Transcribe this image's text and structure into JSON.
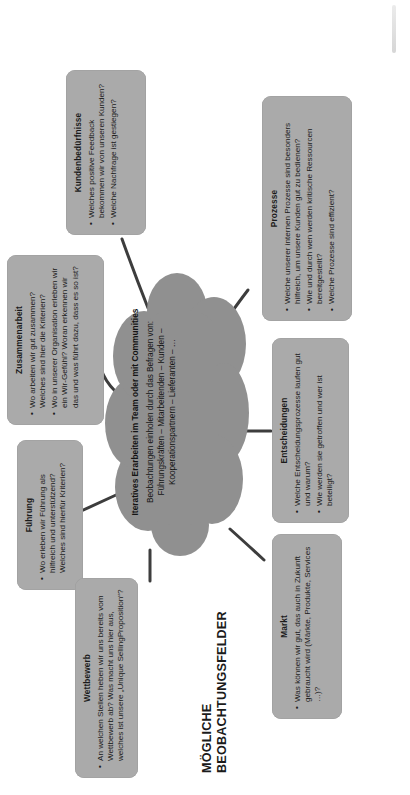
{
  "heading": {
    "line1": "MÖGLICHE",
    "line2": "BEOBACHTUNGSFELDER"
  },
  "colors": {
    "card_fill": "#aaaaaa",
    "cloud_fill": "#909090",
    "connector": "#3d3d3d",
    "text": "#1b1b1b",
    "background": "#ffffff"
  },
  "cloud": {
    "title": "Iteratives Erarbeiten im Team oder mit Communities",
    "body": "Beobachtungen einholen durch das Befragen von: Führungskräften – Mitarbeitenden – Kunden – Kooperationspartnern – Lieferanten – …"
  },
  "cards": {
    "fuehrung": {
      "title": "Führung",
      "bullets": [
        "Wo erleben wir Führung als hilfreich und unterstützend? Welches sind hierfür Kriterien?"
      ]
    },
    "zusammenarbeit": {
      "title": "Zusammenarbeit",
      "bullets": [
        "Wo arbeiten wir gut zusammen? Welches sind hier die Kriterien?",
        "Wo in unserer Organisation erleben wir ein Wir-Gefühl? Woran erkennen wir das und was führt dazu, dass es so ist?"
      ]
    },
    "kundenbeduerfnisse": {
      "title": "Kundenbedürfnisse",
      "bullets": [
        "Welches positive Feedback bekommen wir von unseren Kunden?",
        "Welche Nachfrage ist gestiegen?"
      ]
    },
    "wettbewerb": {
      "title": "Wettbewerb",
      "bullets": [
        "An welchen Stellen heben wir uns bereits vom Wettbewerb ab? Was macht uns hier aus, welches ist unsere „Unique SellingProposition“?"
      ]
    },
    "markt": {
      "title": "Markt",
      "bullets": [
        "Was können wir gut, das auch in Zukunft gebraucht wird (Märkte, Produkte, Services …)?"
      ]
    },
    "entscheidungen": {
      "title": "Entscheidungen",
      "bullets": [
        "Welche Entscheidungsprozesse laufen gut und warum?",
        "Wie werden sie getroffen und wer ist beteiligt?"
      ]
    },
    "prozesse": {
      "title": "Prozesse",
      "bullets": [
        "Welche unserer internen Prozesse sind besonders hilfreich, um unsere Kunden gut zu bedienen?",
        "Wie und durch wen werden kritische Ressourcen bereitgestellt?",
        "Welche Prozesse sind effizient?"
      ]
    }
  }
}
